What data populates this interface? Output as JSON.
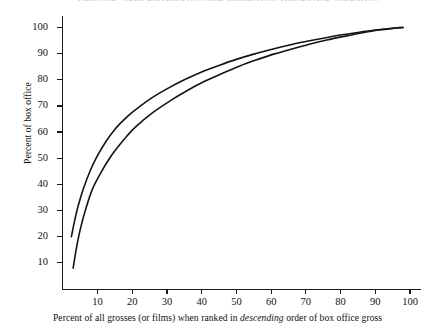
{
  "header": {
    "folio": "1082",
    "title": "FILM AND VIDEO DISTRIBUTION AND EXHIBITION: TRENDS AND VALUATION"
  },
  "chart_data": {
    "type": "line",
    "title": "",
    "xlabel_plain": "Percent of all grosses (or films) when ranked in descending order of box office gross",
    "xlabel_prefix": "Percent of all grosses (or films) when ranked in ",
    "xlabel_emphasis": "descending",
    "xlabel_suffix": " order of box office gross",
    "ylabel": "Percent of box office",
    "xlim": [
      0,
      103
    ],
    "ylim": [
      0,
      104
    ],
    "xticks": [
      10,
      20,
      30,
      40,
      50,
      60,
      70,
      80,
      90,
      100
    ],
    "yticks": [
      10,
      20,
      30,
      40,
      50,
      60,
      70,
      80,
      90,
      100
    ],
    "grid": false,
    "legend": "none",
    "line_color": "#141414",
    "series": [
      {
        "name": "upper-concentration-curve",
        "x": [
          2.5,
          3.5,
          4.5,
          6,
          8,
          10,
          12.5,
          15,
          17.5,
          20,
          25,
          30,
          35,
          40,
          45,
          50,
          55,
          60,
          65,
          70,
          75,
          80,
          85,
          90,
          95,
          98
        ],
        "y": [
          20,
          26.5,
          32,
          38.5,
          45.5,
          51,
          56.5,
          61,
          64.5,
          67.5,
          72.5,
          76.5,
          80,
          83,
          85.5,
          87.8,
          89.8,
          91.6,
          93.2,
          94.6,
          95.9,
          97.1,
          98.1,
          99,
          99.7,
          100
        ]
      },
      {
        "name": "lower-concentration-curve",
        "x": [
          3,
          4,
          5,
          6.5,
          8.5,
          11,
          13.5,
          16,
          18.5,
          21,
          26,
          31,
          36,
          41,
          46,
          51,
          56,
          61,
          66,
          71,
          76,
          81,
          86,
          91,
          95.5,
          98
        ],
        "y": [
          8,
          16,
          22.5,
          30,
          38,
          44.5,
          50,
          54.5,
          58.5,
          62,
          67.5,
          72,
          76,
          79.5,
          82.5,
          85.3,
          87.7,
          89.9,
          91.8,
          93.6,
          95.2,
          96.6,
          97.9,
          99,
          99.7,
          100
        ]
      }
    ]
  }
}
